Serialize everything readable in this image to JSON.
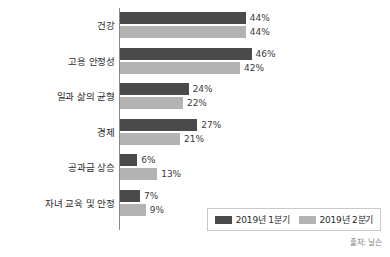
{
  "chart_data": {
    "type": "bar",
    "orientation": "horizontal",
    "title": "",
    "xlabel": "",
    "ylabel": "",
    "xlim": [
      0,
      50
    ],
    "grid": false,
    "legend_position": "bottom-right",
    "categories": [
      "건강",
      "고용 안정성",
      "일과 삶의 균형",
      "경제",
      "공과금 상승",
      "자녀 교육 및 안정"
    ],
    "series": [
      {
        "name": "2019년 1분기",
        "color": "#4a4a4a",
        "values": [
          44,
          46,
          24,
          27,
          6,
          7
        ],
        "labels": [
          "44%",
          "46%",
          "24%",
          "27%",
          "6%",
          "7%"
        ]
      },
      {
        "name": "2019년 2분기",
        "color": "#b3b3b3",
        "values": [
          44,
          42,
          22,
          21,
          13,
          9
        ],
        "labels": [
          "44%",
          "42%",
          "22%",
          "21%",
          "13%",
          "9%"
        ]
      }
    ],
    "source": "출처: 닐슨"
  },
  "legend": {
    "entries": [
      {
        "label": "2019년 1분기"
      },
      {
        "label": "2019년 2분기"
      }
    ]
  },
  "source_note": "출처: 닐슨"
}
